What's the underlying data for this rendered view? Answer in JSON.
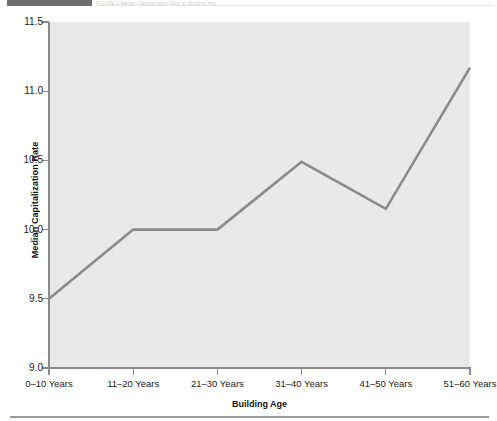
{
  "header": {
    "block_label": "",
    "faint_caption": "FIGURE 1   Median Capitalization Rate by Building Age"
  },
  "chart_data": {
    "type": "line",
    "title": "",
    "xlabel": "Building Age",
    "ylabel": "Median Capitalization Rate",
    "categories": [
      "0–10 Years",
      "11–20 Years",
      "21–30 Years",
      "31–40 Years",
      "41–50 Years",
      "51–60 Years"
    ],
    "values": [
      9.5,
      10.0,
      10.0,
      10.49,
      10.15,
      11.17
    ],
    "ylim": [
      9.0,
      11.5
    ],
    "yticks": [
      9.0,
      9.5,
      10.0,
      10.5,
      11.0,
      11.5
    ],
    "ytick_labels": [
      "9.0",
      "9.5",
      "10.0",
      "10.5",
      "11.0",
      "11.5"
    ],
    "grid": false,
    "legend": false,
    "line_color": "#8a8a8a",
    "plot_background": "#e9e9e9",
    "axis_color": "#8c8c8c"
  }
}
